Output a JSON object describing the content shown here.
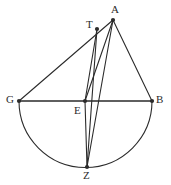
{
  "figure": {
    "width": 171,
    "height": 185,
    "background_color": "#ffffff",
    "stroke_color": "#2b2b2b",
    "label_color": "#2b2b2b"
  },
  "points": [
    {
      "id": "A",
      "label": "A",
      "x": 113,
      "y": 20,
      "label_x": 111,
      "label_y": 4,
      "dot": true
    },
    {
      "id": "T",
      "label": "T",
      "x": 97,
      "y": 29,
      "label_x": 86,
      "label_y": 19,
      "dot": true
    },
    {
      "id": "G",
      "label": "G",
      "x": 19,
      "y": 101,
      "label_x": 6,
      "label_y": 94,
      "dot": true
    },
    {
      "id": "E",
      "label": "E",
      "x": 85,
      "y": 101,
      "label_x": 74,
      "label_y": 105,
      "dot": true
    },
    {
      "id": "B",
      "label": "B",
      "x": 152,
      "y": 101,
      "label_x": 156,
      "label_y": 94,
      "dot": true
    },
    {
      "id": "Z",
      "label": "Z",
      "x": 87,
      "y": 167,
      "label_x": 83,
      "label_y": 170,
      "dot": true
    }
  ],
  "segments": [
    {
      "id": "GB",
      "from": "G",
      "to": "B",
      "name": "diameter-gb"
    },
    {
      "id": "GA",
      "from": "G",
      "to": "A",
      "name": "segment-ga"
    },
    {
      "id": "AB",
      "from": "A",
      "to": "B",
      "name": "segment-ab"
    },
    {
      "id": "AE",
      "from": "A",
      "to": "E",
      "name": "segment-ae"
    },
    {
      "id": "AZ",
      "from": "A",
      "to": "Z",
      "name": "segment-az"
    },
    {
      "id": "TZ",
      "from": "T",
      "to": "Z",
      "name": "segment-tz"
    },
    {
      "id": "TE",
      "from": "T",
      "to": "E",
      "name": "segment-te"
    },
    {
      "id": "EZ",
      "from": "E",
      "to": "Z",
      "name": "segment-ez"
    }
  ],
  "arcs": [
    {
      "id": "semicircle-GZB",
      "name": "semicircle-arc",
      "center_x": 85,
      "center_y": 101,
      "radius_x": 66,
      "radius_y": 66,
      "from": "G",
      "to": "B",
      "through": "Z",
      "path": "M 19 101 A 66 66 0 0 0 152 101"
    }
  ]
}
